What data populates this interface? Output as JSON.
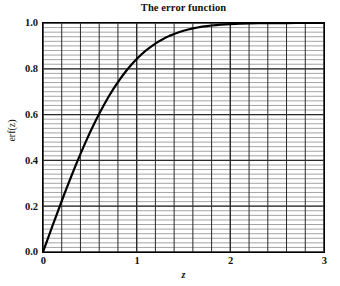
{
  "chart_data": {
    "type": "line",
    "title": "The error function",
    "xlabel": "z",
    "ylabel": "erf(z)",
    "xlim": [
      0,
      3
    ],
    "ylim": [
      0,
      1.0
    ],
    "grid": true,
    "legend": "none",
    "xticks": [
      "0",
      "1",
      "2",
      "3"
    ],
    "xtick_values": [
      0,
      1,
      2,
      3
    ],
    "yticks": [
      "0.0",
      "0.2",
      "0.4",
      "0.6",
      "0.8",
      "1.0"
    ],
    "ytick_values": [
      0.0,
      0.2,
      0.4,
      0.6,
      0.8,
      1.0
    ],
    "x_minor_step": 0.2,
    "y_minor_step": 0.02,
    "series": [
      {
        "name": "erf(z)",
        "color": "#000000",
        "linewidth": 2.2,
        "x": [
          0.0,
          0.05,
          0.1,
          0.15,
          0.2,
          0.25,
          0.3,
          0.35,
          0.4,
          0.45,
          0.5,
          0.55,
          0.6,
          0.65,
          0.7,
          0.75,
          0.8,
          0.85,
          0.9,
          0.95,
          1.0,
          1.05,
          1.1,
          1.15,
          1.2,
          1.25,
          1.3,
          1.35,
          1.4,
          1.45,
          1.5,
          1.55,
          1.6,
          1.65,
          1.7,
          1.75,
          1.8,
          1.85,
          1.9,
          1.95,
          2.0,
          2.1,
          2.2,
          2.3,
          2.4,
          2.5,
          2.6,
          2.7,
          2.8,
          2.9,
          3.0
        ],
        "y": [
          0.0,
          0.0564,
          0.1125,
          0.168,
          0.2227,
          0.2763,
          0.3286,
          0.3794,
          0.4284,
          0.4755,
          0.5205,
          0.5633,
          0.6039,
          0.642,
          0.6778,
          0.7112,
          0.7421,
          0.7707,
          0.7969,
          0.8209,
          0.8427,
          0.8624,
          0.8802,
          0.8961,
          0.9103,
          0.9229,
          0.934,
          0.9438,
          0.9523,
          0.9597,
          0.9661,
          0.9716,
          0.9763,
          0.9804,
          0.9838,
          0.9867,
          0.9891,
          0.9911,
          0.9928,
          0.9942,
          0.9953,
          0.997,
          0.9981,
          0.9989,
          0.9993,
          0.9996,
          0.9998,
          0.9999,
          0.9999,
          1.0,
          1.0
        ]
      }
    ]
  },
  "colors": {
    "axis": "#000000",
    "major_grid": "#2a2a2a",
    "minor_grid": "#9a9a9a",
    "curve": "#000000",
    "background": "#ffffff"
  }
}
